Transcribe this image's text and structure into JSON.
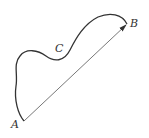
{
  "diagram": {
    "labels": {
      "A": "A",
      "B": "B",
      "C": "C"
    },
    "colors": {
      "curve": "#333333",
      "arrow": "#555555",
      "background": "#ffffff"
    }
  }
}
